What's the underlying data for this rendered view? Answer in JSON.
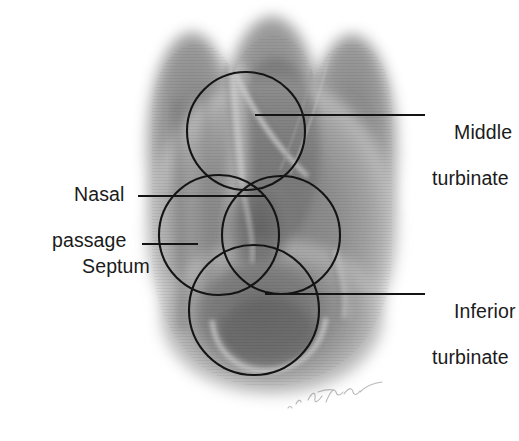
{
  "figure": {
    "type": "endoscopic-anatomy-illustration",
    "background_color": "#ffffff",
    "annotation_color": "#111111",
    "tissue_colors": {
      "darkest": "#6e6e6e",
      "mid": "#8d8d8d",
      "light": "#b4b4b4",
      "highlight": "#d8d8d8"
    }
  },
  "labels": {
    "middle_turbinate": {
      "line1": "Middle",
      "line2": "turbinate"
    },
    "inferior_turbinate": {
      "line1": "Inferior",
      "line2": "turbinate"
    },
    "nasal_passage": {
      "line1": "Nasal",
      "line2": "passage"
    },
    "septum": {
      "line1": "Septum",
      "line2": ""
    }
  },
  "leader_lines": [
    {
      "name": "middle-turbinate-leader",
      "x1": 255,
      "y1": 115,
      "x2": 425,
      "y2": 115
    },
    {
      "name": "inferior-turbinate-leader",
      "x1": 265,
      "y1": 294,
      "x2": 425,
      "y2": 294
    },
    {
      "name": "nasal-passage-leader",
      "x1": 138,
      "y1": 196,
      "x2": 266,
      "y2": 196
    },
    {
      "name": "septum-leader",
      "x1": 142,
      "y1": 244,
      "x2": 198,
      "y2": 244
    }
  ],
  "annotation_circles": [
    {
      "name": "circle-middle-turbinate",
      "cx": 246,
      "cy": 131,
      "r": 59
    },
    {
      "name": "circle-nasal-passage",
      "cx": 219,
      "cy": 235,
      "r": 60
    },
    {
      "name": "circle-septum-region",
      "cx": 281,
      "cy": 235,
      "r": 59
    },
    {
      "name": "circle-inferior-turbinate",
      "cx": 254,
      "cy": 310,
      "r": 65
    }
  ],
  "signature": {
    "present": true,
    "text": "artist-signature",
    "x": 295,
    "y": 400
  }
}
